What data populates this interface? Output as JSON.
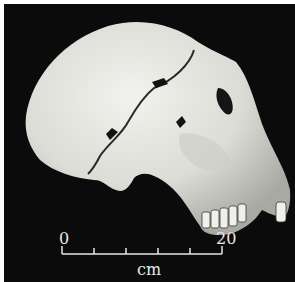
{
  "figure": {
    "background_color": "#0b0b0b",
    "bone_color": "#e6e6e2"
  },
  "scale_bar": {
    "start_label": "0",
    "end_label": "20",
    "unit": "cm",
    "tick_count": 6
  }
}
